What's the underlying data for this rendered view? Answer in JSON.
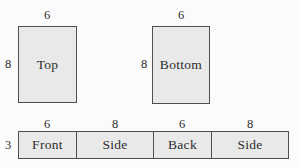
{
  "figure": {
    "name": "rectangular-box-net",
    "colors": {
      "background": "#fbfbfb",
      "face_fill": "#e9e9e9",
      "face_border": "#4f4f4f",
      "text": "#2d2d2d"
    },
    "top_face": {
      "label": "Top",
      "width_dim": "6",
      "height_dim": "8"
    },
    "bottom_face": {
      "label": "Bottom",
      "width_dim": "6",
      "height_dim": "8"
    },
    "strip": {
      "height_dim": "3",
      "cells": [
        {
          "label": "Front",
          "width_dim": "6",
          "width_units": 6
        },
        {
          "label": "Side",
          "width_dim": "8",
          "width_units": 8
        },
        {
          "label": "Back",
          "width_dim": "6",
          "width_units": 6
        },
        {
          "label": "Side",
          "width_dim": "8",
          "width_units": 8
        }
      ]
    }
  }
}
